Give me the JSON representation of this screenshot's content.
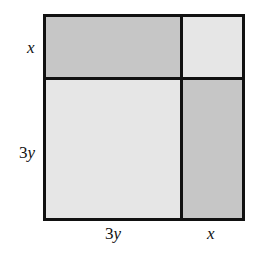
{
  "figure": {
    "colors": {
      "dark_region": "#c6c6c6",
      "light_region": "#e6e6e6",
      "border": "#111111"
    },
    "regions": [
      {
        "id": "top-left",
        "width_label": "3y",
        "height_label": "x",
        "shade": "dark"
      },
      {
        "id": "top-right",
        "width_label": "x",
        "height_label": "x",
        "shade": "light"
      },
      {
        "id": "bottom-left",
        "width_label": "3y",
        "height_label": "3y",
        "shade": "light"
      },
      {
        "id": "bottom-right",
        "width_label": "x",
        "height_label": "3y",
        "shade": "dark"
      }
    ],
    "labels": {
      "left_top": {
        "coef": "",
        "var": "x"
      },
      "left_bottom": {
        "coef": "3",
        "var": "y"
      },
      "bottom_left": {
        "coef": "3",
        "var": "y"
      },
      "bottom_right": {
        "coef": "",
        "var": "x"
      }
    }
  }
}
